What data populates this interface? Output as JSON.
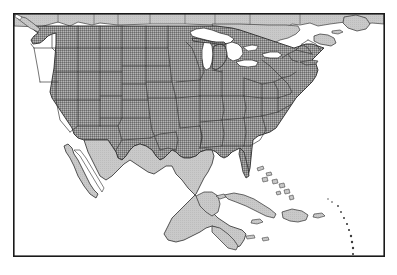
{
  "figure": {
    "title": "Map of North America with contiguous United States highlighted",
    "type": "choropleth-outline-map",
    "caption": "",
    "width": 397,
    "height": 275
  },
  "frame": {
    "name": "map-border",
    "x": 13,
    "y": 13,
    "width": 372,
    "height": 244,
    "stroke_color": "#1a1a1a",
    "stroke_width": 1.6,
    "fill_color": "#ffffff"
  },
  "colors": {
    "background": "#ffffff",
    "ocean": "#ffffff",
    "highlight_fill": "#8d8d8d",
    "highlight_dither_light": "#b4b4b4",
    "highlight_dither_dark": "#6a6a6a",
    "neutral_land_fill": "#c9c9c9",
    "lake_fill": "#ffffff",
    "coastline_stroke": "#2b2b2b",
    "internal_border_stroke": "#3c3c3c",
    "frame_stroke": "#1a1a1a"
  },
  "legend": {
    "visible": false,
    "entries": [
      {
        "label": "Contiguous United States",
        "swatch": "#8d8d8d"
      },
      {
        "label": "Other land (Canada, Mexico, Caribbean, Central America)",
        "swatch": "#c9c9c9"
      },
      {
        "label": "Water (oceans and Great Lakes)",
        "swatch": "#ffffff"
      }
    ]
  },
  "regions": {
    "highlighted": {
      "name": "Contiguous United States",
      "fill": "#8d8d8d",
      "count": 48,
      "members": [
        "Washington",
        "Oregon",
        "California",
        "Idaho",
        "Nevada",
        "Montana",
        "Wyoming",
        "Utah",
        "Arizona",
        "Colorado",
        "New Mexico",
        "North Dakota",
        "South Dakota",
        "Nebraska",
        "Kansas",
        "Oklahoma",
        "Texas",
        "Minnesota",
        "Iowa",
        "Missouri",
        "Arkansas",
        "Louisiana",
        "Wisconsin",
        "Illinois",
        "Michigan",
        "Indiana",
        "Ohio",
        "Kentucky",
        "Tennessee",
        "Mississippi",
        "Alabama",
        "Georgia",
        "Florida",
        "South Carolina",
        "North Carolina",
        "Virginia",
        "West Virginia",
        "Maryland",
        "Delaware",
        "Pennsylvania",
        "New Jersey",
        "New York",
        "Connecticut",
        "Rhode Island",
        "Massachusetts",
        "Vermont",
        "New Hampshire",
        "Maine"
      ]
    },
    "neutral": {
      "name": "Surrounding land",
      "fill": "#c9c9c9",
      "members": [
        "Canada",
        "Mexico",
        "Baja California peninsula",
        "Guatemala",
        "Belize",
        "Honduras",
        "Cuba",
        "Hispaniola",
        "Jamaica",
        "Bahamas",
        "Nova Scotia",
        "Newfoundland",
        "Yucatan Peninsula"
      ]
    },
    "water": {
      "name": "Water bodies",
      "fill": "#ffffff",
      "members": [
        "Pacific Ocean",
        "Atlantic Ocean",
        "Gulf of Mexico",
        "Caribbean Sea",
        "Lake Superior",
        "Lake Michigan",
        "Lake Huron",
        "Lake Erie",
        "Lake Ontario",
        "Hudson Bay",
        "Gulf of California"
      ]
    }
  },
  "annotations": {
    "labels": [],
    "text_visible": "none"
  }
}
